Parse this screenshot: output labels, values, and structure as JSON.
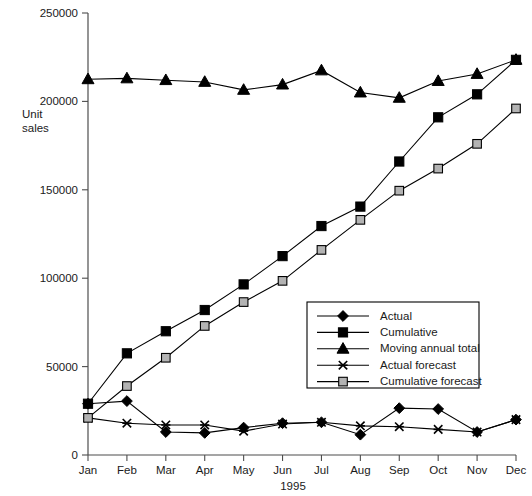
{
  "chart_data": {
    "type": "line",
    "title": "",
    "xlabel": "1995",
    "ylabel": "Unit sales",
    "categories": [
      "Jan",
      "Feb",
      "Mar",
      "Apr",
      "May",
      "Jun",
      "Jul",
      "Aug",
      "Sep",
      "Oct",
      "Nov",
      "Dec"
    ],
    "ylim": [
      0,
      250000
    ],
    "yticks": [
      0,
      50000,
      100000,
      150000,
      200000,
      250000
    ],
    "ytick_labels": [
      "0",
      "50000",
      "100000",
      "150000",
      "200000",
      "250000"
    ],
    "grid": false,
    "legend_position": "inside-bottom-right",
    "series": [
      {
        "name": "Actual",
        "marker": "diamond",
        "values": [
          29000,
          30500,
          13000,
          12500,
          15500,
          18000,
          18500,
          11500,
          26500,
          26000,
          13000,
          20000
        ]
      },
      {
        "name": "Cumulative",
        "marker": "square",
        "values": [
          29000,
          57500,
          70000,
          82000,
          96500,
          112500,
          129500,
          140500,
          166000,
          191000,
          204000,
          223500
        ]
      },
      {
        "name": "Moving annual total",
        "marker": "triangle",
        "values": [
          212500,
          213000,
          212000,
          211000,
          206500,
          209500,
          217500,
          205000,
          202000,
          211500,
          215500,
          223500
        ]
      },
      {
        "name": "Actual forecast",
        "marker": "cross",
        "values": [
          21000,
          18000,
          17000,
          17000,
          13500,
          17500,
          18500,
          16500,
          16000,
          14500,
          13000,
          20000
        ]
      },
      {
        "name": "Cumulative forecast",
        "marker": "square-open",
        "values": [
          21000,
          39000,
          55000,
          73000,
          86500,
          98500,
          116000,
          133000,
          149500,
          162000,
          176000,
          196000
        ]
      }
    ]
  },
  "legend": {
    "items": [
      {
        "label": "Actual"
      },
      {
        "label": "Cumulative"
      },
      {
        "label": "Moving annual total"
      },
      {
        "label": "Actual forecast"
      },
      {
        "label": "Cumulative forecast"
      }
    ]
  },
  "colors": {
    "line": "#000000",
    "marker_fill": "#000000",
    "marker_open_fill": "#b3b3b3",
    "axis": "#4d4d4d",
    "text": "#1a1a1a",
    "background": "#ffffff"
  }
}
